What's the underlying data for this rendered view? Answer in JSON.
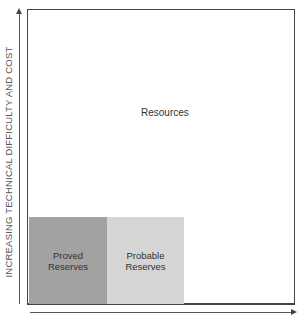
{
  "diagram": {
    "y_axis": {
      "label": "INCREASING TECHNICAL DIFFICULTY AND COST",
      "direction": "up"
    },
    "x_axis": {
      "label": "",
      "direction": "right"
    },
    "regions": {
      "resources": {
        "label": "Resources",
        "color": "#ffffff"
      },
      "proved": {
        "line1": "Proved",
        "line2": "Reserves",
        "color": "#a2a2a2"
      },
      "probable": {
        "line1": "Probable",
        "line2": "Reserves",
        "color": "#d5d5d5"
      }
    }
  }
}
